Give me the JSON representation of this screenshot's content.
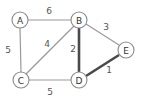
{
  "graph": {
    "nodes": [
      {
        "id": "A",
        "label": "A",
        "x": 20,
        "y": 20
      },
      {
        "id": "B",
        "label": "B",
        "x": 79,
        "y": 20
      },
      {
        "id": "C",
        "label": "C",
        "x": 21,
        "y": 80
      },
      {
        "id": "D",
        "label": "D",
        "x": 79,
        "y": 80
      },
      {
        "id": "E",
        "label": "E",
        "x": 126,
        "y": 50
      }
    ],
    "edges": [
      {
        "from": "A",
        "to": "B",
        "weight": "6",
        "highlighted": false
      },
      {
        "from": "A",
        "to": "C",
        "weight": "5",
        "highlighted": false
      },
      {
        "from": "B",
        "to": "C",
        "weight": "4",
        "highlighted": false
      },
      {
        "from": "B",
        "to": "D",
        "weight": "2",
        "highlighted": true
      },
      {
        "from": "B",
        "to": "E",
        "weight": "3",
        "highlighted": false
      },
      {
        "from": "C",
        "to": "D",
        "weight": "5",
        "highlighted": false
      },
      {
        "from": "D",
        "to": "E",
        "weight": "1",
        "highlighted": true
      }
    ],
    "colors": {
      "edge_default": "#9a9a9a",
      "edge_highlighted": "#4a4a4a",
      "node_stroke": "#8a8a8a",
      "node_fill": "#ffffff",
      "text": "#333333"
    }
  }
}
